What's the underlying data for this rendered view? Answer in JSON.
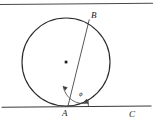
{
  "figure": {
    "type": "geometry-diagram",
    "canvas": {
      "width": 153,
      "height": 130
    },
    "background_color": "#ffffff",
    "stroke_color": "#2b2b2b",
    "thin_stroke_color": "#555555"
  },
  "labels": {
    "point_a": "A",
    "point_b": "B",
    "point_c": "C",
    "angle_phi": "ϕ"
  },
  "geometry": {
    "circle": {
      "center_x": 66,
      "center_y": 62,
      "radius": 44,
      "stroke_width": 1.1
    },
    "center_dot": {
      "x": 66,
      "y": 62,
      "size": 2.6
    },
    "tangent_line_bottom": {
      "x1": 2,
      "y1": 107,
      "x2": 151,
      "y2": 106,
      "stroke_width": 1.0
    },
    "tangent_line_top": {
      "x1": 0,
      "y1": 5,
      "x2": 153,
      "y2": 3,
      "stroke_width": 1.0
    },
    "chord_ab": {
      "x1": 68,
      "y1": 106,
      "x2": 89,
      "y2": 20,
      "stroke_width": 0.9
    },
    "angle_arc": {
      "center_x": 68,
      "center_y": 106,
      "radius": 20,
      "start_angle_deg": 256,
      "end_angle_deg": 358
    },
    "point_positions": {
      "a_x": 68,
      "a_y": 106,
      "b_x": 89,
      "b_y": 20,
      "c_x": 133,
      "c_y": 106
    }
  },
  "label_positions": {
    "a": {
      "left": 63,
      "top": 110
    },
    "b": {
      "left": 91,
      "top": 12
    },
    "c": {
      "left": 129,
      "top": 111
    },
    "phi": {
      "left": 80,
      "top": 92
    }
  }
}
